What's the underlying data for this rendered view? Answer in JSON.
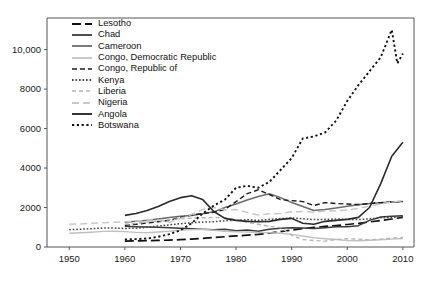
{
  "chart_data": {
    "type": "line",
    "title": "",
    "subtitle": "",
    "xlabel": "",
    "ylabel": "",
    "xlim": [
      1946,
      2012
    ],
    "ylim": [
      0,
      11600
    ],
    "xticks": [
      1950,
      1960,
      1970,
      1980,
      1990,
      2000,
      2010
    ],
    "xtick_labels": [
      "1950",
      "1960",
      "1970",
      "1980",
      "1990",
      "2000",
      "2010"
    ],
    "yticks": [
      0,
      2000,
      4000,
      6000,
      8000,
      10000
    ],
    "ytick_labels": [
      "0",
      "2000",
      "4000",
      "6000",
      "8000",
      "10,000"
    ],
    "grid": false,
    "legend_position": "top-left",
    "series": [
      {
        "name": "Lesotho",
        "color": "#111111",
        "dash": "9,4",
        "width": 1.7,
        "x": [
          1960,
          1962,
          1964,
          1966,
          1968,
          1970,
          1972,
          1974,
          1976,
          1978,
          1980,
          1982,
          1984,
          1986,
          1988,
          1990,
          1992,
          1994,
          1996,
          1998,
          2000,
          2002,
          2004,
          2006,
          2008,
          2010
        ],
        "y": [
          300,
          310,
          320,
          335,
          350,
          370,
          400,
          440,
          480,
          520,
          560,
          600,
          640,
          700,
          780,
          860,
          930,
          990,
          1040,
          1090,
          1140,
          1200,
          1270,
          1340,
          1420,
          1500
        ]
      },
      {
        "name": "Chad",
        "color": "#3a3a3a",
        "dash": "",
        "width": 1.5,
        "x": [
          1960,
          1962,
          1964,
          1966,
          1968,
          1970,
          1972,
          1974,
          1976,
          1978,
          1980,
          1982,
          1984,
          1986,
          1988,
          1990,
          1992,
          1994,
          1996,
          1998,
          2000,
          2002,
          2004,
          2006,
          2008,
          2010
        ],
        "y": [
          1050,
          1030,
          1010,
          1000,
          980,
          950,
          930,
          900,
          880,
          900,
          820,
          860,
          800,
          900,
          950,
          980,
          960,
          940,
          980,
          1030,
          1020,
          1080,
          1350,
          1520,
          1560,
          1580
        ]
      },
      {
        "name": "Cameroon",
        "color": "#6b6b6b",
        "dash": "",
        "width": 1.5,
        "x": [
          1960,
          1962,
          1964,
          1966,
          1968,
          1970,
          1972,
          1974,
          1976,
          1978,
          1980,
          1982,
          1984,
          1986,
          1988,
          1990,
          1992,
          1994,
          1996,
          1998,
          2000,
          2002,
          2004,
          2006,
          2008,
          2010
        ],
        "y": [
          1250,
          1300,
          1350,
          1420,
          1500,
          1560,
          1600,
          1680,
          1780,
          2000,
          2180,
          2380,
          2560,
          2700,
          2500,
          2250,
          2050,
          1850,
          1900,
          1980,
          2060,
          2140,
          2200,
          2240,
          2280,
          2300
        ]
      },
      {
        "name": "Congo, Democratic Republic",
        "color": "#c0c0c0",
        "dash": "",
        "width": 1.4,
        "x": [
          1950,
          1952,
          1954,
          1956,
          1958,
          1960,
          1962,
          1964,
          1966,
          1968,
          1970,
          1972,
          1974,
          1976,
          1978,
          1980,
          1982,
          1984,
          1986,
          1988,
          1990,
          1992,
          1994,
          1996,
          1998,
          2000,
          2002,
          2004,
          2006,
          2008,
          2010
        ],
        "y": [
          700,
          720,
          750,
          790,
          800,
          780,
          740,
          720,
          760,
          800,
          850,
          880,
          900,
          850,
          800,
          770,
          760,
          740,
          720,
          700,
          640,
          560,
          470,
          420,
          380,
          330,
          320,
          340,
          370,
          400,
          430
        ]
      },
      {
        "name": "Congo, Republic of",
        "color": "#1a1a1a",
        "dash": "5,3",
        "width": 1.4,
        "x": [
          1960,
          1962,
          1964,
          1966,
          1968,
          1970,
          1972,
          1974,
          1976,
          1978,
          1980,
          1982,
          1984,
          1986,
          1988,
          1990,
          1992,
          1994,
          1996,
          1998,
          2000,
          2002,
          2004,
          2006,
          2008,
          2010
        ],
        "y": [
          1100,
          1150,
          1220,
          1280,
          1350,
          1500,
          1620,
          1700,
          1760,
          1900,
          2300,
          2700,
          2900,
          2650,
          2400,
          2350,
          2300,
          2100,
          2250,
          2200,
          2180,
          2150,
          2200,
          2250,
          2280,
          2300
        ]
      },
      {
        "name": "Kenya",
        "color": "#444444",
        "dash": "1.6,1.9",
        "width": 1.5,
        "x": [
          1950,
          1952,
          1954,
          1956,
          1958,
          1960,
          1962,
          1964,
          1966,
          1968,
          1970,
          1972,
          1974,
          1976,
          1978,
          1980,
          1982,
          1984,
          1986,
          1988,
          1990,
          1992,
          1994,
          1996,
          1998,
          2000,
          2002,
          2004,
          2006,
          2008,
          2010
        ],
        "y": [
          880,
          900,
          930,
          960,
          960,
          940,
          950,
          1000,
          1060,
          1120,
          1180,
          1230,
          1260,
          1280,
          1330,
          1360,
          1380,
          1350,
          1400,
          1440,
          1470,
          1430,
          1390,
          1400,
          1420,
          1400,
          1390,
          1430,
          1480,
          1500,
          1530
        ]
      },
      {
        "name": "Liberia",
        "color": "#b5b5b5",
        "dash": "4,3",
        "width": 1.4,
        "x": [
          1960,
          1962,
          1964,
          1966,
          1968,
          1970,
          1972,
          1974,
          1976,
          1978,
          1980,
          1982,
          1984,
          1986,
          1988,
          1990,
          1992,
          1994,
          1996,
          1998,
          2000,
          2002,
          2004,
          2006,
          2008,
          2010
        ],
        "y": [
          1150,
          1200,
          1260,
          1320,
          1380,
          1430,
          1460,
          1480,
          1500,
          1480,
          1400,
          1250,
          1150,
          1050,
          980,
          600,
          380,
          330,
          300,
          380,
          420,
          400,
          360,
          400,
          450,
          480
        ]
      },
      {
        "name": "Nigeria",
        "color": "#c8c8c8",
        "dash": "7,4",
        "width": 1.5,
        "x": [
          1950,
          1952,
          1954,
          1956,
          1958,
          1960,
          1962,
          1964,
          1966,
          1968,
          1970,
          1972,
          1974,
          1976,
          1978,
          1980,
          1982,
          1984,
          1986,
          1988,
          1990,
          1992,
          1994,
          1996,
          1998,
          2000,
          2002,
          2004,
          2006,
          2008,
          2010
        ],
        "y": [
          1150,
          1170,
          1200,
          1230,
          1250,
          1280,
          1300,
          1380,
          1360,
          1240,
          1450,
          1650,
          1900,
          2000,
          1880,
          1900,
          1750,
          1620,
          1680,
          1700,
          1780,
          1800,
          1760,
          1820,
          1840,
          1870,
          1950,
          2080,
          2180,
          2280,
          2350
        ]
      },
      {
        "name": "Angola",
        "color": "#2b2b2b",
        "dash": "",
        "width": 1.6,
        "x": [
          1960,
          1962,
          1964,
          1966,
          1968,
          1970,
          1972,
          1974,
          1976,
          1978,
          1980,
          1982,
          1984,
          1986,
          1988,
          1990,
          1992,
          1994,
          1996,
          1998,
          2000,
          2002,
          2004,
          2006,
          2008,
          2010
        ],
        "y": [
          1600,
          1700,
          1850,
          2050,
          2300,
          2500,
          2600,
          2400,
          1800,
          1450,
          1350,
          1300,
          1280,
          1300,
          1400,
          1450,
          1200,
          1150,
          1300,
          1350,
          1400,
          1500,
          2000,
          3200,
          4600,
          5300
        ]
      },
      {
        "name": "Botswana",
        "color": "#121212",
        "dash": "2.2,2.6",
        "width": 1.9,
        "x": [
          1960,
          1962,
          1964,
          1966,
          1968,
          1970,
          1972,
          1974,
          1976,
          1978,
          1980,
          1982,
          1984,
          1986,
          1988,
          1990,
          1992,
          1994,
          1996,
          1998,
          2000,
          2002,
          2004,
          2006,
          2008,
          2009,
          2010
        ],
        "y": [
          380,
          400,
          430,
          520,
          650,
          850,
          1200,
          1700,
          2100,
          2400,
          3000,
          3100,
          3000,
          3300,
          3900,
          4500,
          5500,
          5600,
          5800,
          6400,
          7400,
          8200,
          8900,
          9600,
          11000,
          9300,
          9800
        ]
      }
    ]
  },
  "legend": {
    "items": [
      {
        "label": "Lesotho"
      },
      {
        "label": "Chad"
      },
      {
        "label": "Cameroon"
      },
      {
        "label": "Congo, Democratic Republic"
      },
      {
        "label": "Congo, Republic of"
      },
      {
        "label": "Kenya"
      },
      {
        "label": "Liberia"
      },
      {
        "label": "Nigeria"
      },
      {
        "label": "Angola"
      },
      {
        "label": "Botswana"
      }
    ]
  },
  "axes": {
    "frame_color": "#555555"
  }
}
